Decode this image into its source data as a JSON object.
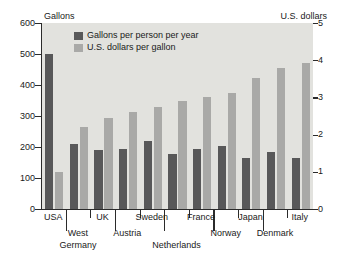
{
  "chart_data": {
    "type": "bar",
    "title": "",
    "categories": [
      "USA",
      "West Germany",
      "UK",
      "Austria",
      "Sweden",
      "Netherlands",
      "France",
      "Norway",
      "Japan",
      "Denmark",
      "Italy"
    ],
    "series": [
      {
        "name": "Gallons per person per year",
        "axis": "left",
        "color": "#585859",
        "values": [
          500,
          210,
          191,
          193,
          220,
          178,
          192,
          203,
          163,
          184,
          165
        ]
      },
      {
        "name": "U.S. dollars per gallon",
        "axis": "right",
        "color": "#a9a9a7",
        "values": [
          1.0,
          2.2,
          2.45,
          2.6,
          2.75,
          2.9,
          3.0,
          3.12,
          3.53,
          3.78,
          3.92
        ]
      }
    ],
    "left_axis": {
      "label": "Gallons",
      "ticks": [
        0,
        100,
        200,
        300,
        400,
        500,
        600
      ],
      "ylim": [
        0,
        600
      ]
    },
    "right_axis": {
      "label": "U.S. dollars",
      "ticks": [
        0,
        1,
        2,
        3,
        4,
        5
      ],
      "ylim": [
        0,
        5
      ]
    },
    "grid": false,
    "legend_position": "upper center"
  },
  "legend": {
    "items": [
      {
        "label": "Gallons per person per year"
      },
      {
        "label": "U.S. dollars per gallon"
      }
    ]
  },
  "axes": {
    "left_caption": "Gallons",
    "right_caption": "U.S. dollars"
  },
  "category_labels": [
    {
      "text": "USA",
      "row": 0
    },
    {
      "text": "West",
      "row": 1
    },
    {
      "text": "Germany",
      "row": 2
    },
    {
      "text": "UK",
      "row": 0
    },
    {
      "text": "Austria",
      "row": 1
    },
    {
      "text": "Sweden",
      "row": 0
    },
    {
      "text": "Netherlands",
      "row": 2
    },
    {
      "text": "France",
      "row": 0
    },
    {
      "text": "Norway",
      "row": 1
    },
    {
      "text": "Japan",
      "row": 0
    },
    {
      "text": "Denmark",
      "row": 1
    },
    {
      "text": "Italy",
      "row": 0
    }
  ],
  "colors": {
    "dark_bar": "#585859",
    "light_bar": "#a9a9a7",
    "plot_background": "#e2e2de",
    "axis": "#2b2b2b"
  }
}
